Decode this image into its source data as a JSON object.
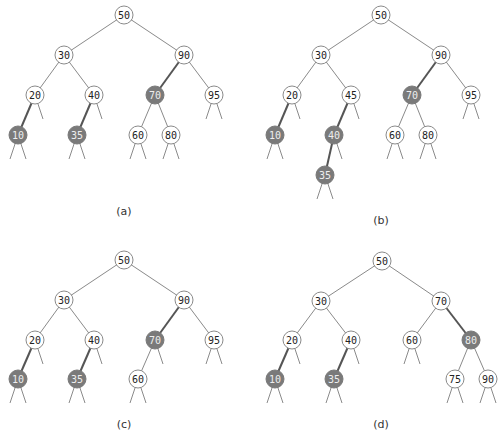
{
  "figure": {
    "panels": [
      {
        "id": "a",
        "caption": "(a)",
        "caption_pos": [
          124,
          215
        ],
        "nodes": [
          {
            "key": "50",
            "x": 124,
            "y": 15,
            "shaded": false
          },
          {
            "key": "30",
            "x": 64,
            "y": 55,
            "shaded": false
          },
          {
            "key": "90",
            "x": 184,
            "y": 55,
            "shaded": false
          },
          {
            "key": "20",
            "x": 35,
            "y": 95,
            "shaded": false
          },
          {
            "key": "40",
            "x": 94,
            "y": 95,
            "shaded": false
          },
          {
            "key": "70",
            "x": 155,
            "y": 95,
            "shaded": true
          },
          {
            "key": "95",
            "x": 214,
            "y": 95,
            "shaded": false
          },
          {
            "key": "10",
            "x": 18,
            "y": 135,
            "shaded": true
          },
          {
            "key": "35",
            "x": 77,
            "y": 135,
            "shaded": true
          },
          {
            "key": "60",
            "x": 138,
            "y": 135,
            "shaded": false
          },
          {
            "key": "80",
            "x": 171,
            "y": 135,
            "shaded": false
          }
        ],
        "edges": [
          [
            "50",
            "30",
            false
          ],
          [
            "50",
            "90",
            false
          ],
          [
            "30",
            "20",
            false
          ],
          [
            "30",
            "40",
            false
          ],
          [
            "90",
            "70",
            true
          ],
          [
            "90",
            "95",
            false
          ],
          [
            "20",
            "10",
            true
          ],
          [
            "40",
            "35",
            true
          ],
          [
            "70",
            "60",
            false
          ],
          [
            "70",
            "80",
            false
          ]
        ],
        "stubs": [
          [
            "20",
            1
          ],
          [
            "40",
            1
          ],
          [
            "95",
            0
          ],
          [
            "95",
            1
          ],
          [
            "10",
            0
          ],
          [
            "10",
            1
          ],
          [
            "35",
            0
          ],
          [
            "35",
            1
          ],
          [
            "60",
            0
          ],
          [
            "60",
            1
          ],
          [
            "80",
            0
          ],
          [
            "80",
            1
          ]
        ]
      },
      {
        "id": "b",
        "caption": "(b)",
        "caption_pos": [
          381,
          224
        ],
        "nodes": [
          {
            "key": "50",
            "x": 381,
            "y": 15,
            "shaded": false
          },
          {
            "key": "30",
            "x": 321,
            "y": 55,
            "shaded": false
          },
          {
            "key": "90",
            "x": 441,
            "y": 55,
            "shaded": false
          },
          {
            "key": "20",
            "x": 292,
            "y": 95,
            "shaded": false
          },
          {
            "key": "45",
            "x": 351,
            "y": 95,
            "shaded": false
          },
          {
            "key": "70",
            "x": 412,
            "y": 95,
            "shaded": true
          },
          {
            "key": "95",
            "x": 471,
            "y": 95,
            "shaded": false
          },
          {
            "key": "10",
            "x": 275,
            "y": 135,
            "shaded": true
          },
          {
            "key": "40",
            "x": 334,
            "y": 135,
            "shaded": true
          },
          {
            "key": "60",
            "x": 395,
            "y": 135,
            "shaded": false
          },
          {
            "key": "80",
            "x": 428,
            "y": 135,
            "shaded": false
          },
          {
            "key": "35",
            "x": 325,
            "y": 175,
            "shaded": true
          }
        ],
        "edges": [
          [
            "50",
            "30",
            false
          ],
          [
            "50",
            "90",
            false
          ],
          [
            "30",
            "20",
            false
          ],
          [
            "30",
            "45",
            false
          ],
          [
            "90",
            "70",
            true
          ],
          [
            "90",
            "95",
            false
          ],
          [
            "20",
            "10",
            true
          ],
          [
            "45",
            "40",
            true
          ],
          [
            "70",
            "60",
            false
          ],
          [
            "70",
            "80",
            false
          ],
          [
            "40",
            "35",
            true
          ]
        ],
        "stubs": [
          [
            "20",
            1
          ],
          [
            "45",
            1
          ],
          [
            "95",
            0
          ],
          [
            "95",
            1
          ],
          [
            "10",
            0
          ],
          [
            "10",
            1
          ],
          [
            "40",
            1
          ],
          [
            "60",
            0
          ],
          [
            "60",
            1
          ],
          [
            "80",
            0
          ],
          [
            "80",
            1
          ],
          [
            "35",
            0
          ],
          [
            "35",
            1
          ]
        ]
      },
      {
        "id": "c",
        "caption": "(c)",
        "caption_pos": [
          124,
          428
        ],
        "nodes": [
          {
            "key": "50",
            "x": 124,
            "y": 260,
            "shaded": false
          },
          {
            "key": "30",
            "x": 64,
            "y": 300,
            "shaded": false
          },
          {
            "key": "90",
            "x": 184,
            "y": 300,
            "shaded": false
          },
          {
            "key": "20",
            "x": 35,
            "y": 340,
            "shaded": false
          },
          {
            "key": "40",
            "x": 94,
            "y": 340,
            "shaded": false
          },
          {
            "key": "70",
            "x": 155,
            "y": 340,
            "shaded": true
          },
          {
            "key": "95",
            "x": 214,
            "y": 340,
            "shaded": false
          },
          {
            "key": "10",
            "x": 18,
            "y": 379,
            "shaded": true
          },
          {
            "key": "35",
            "x": 77,
            "y": 379,
            "shaded": true
          },
          {
            "key": "60",
            "x": 138,
            "y": 379,
            "shaded": false
          }
        ],
        "edges": [
          [
            "50",
            "30",
            false
          ],
          [
            "50",
            "90",
            false
          ],
          [
            "30",
            "20",
            false
          ],
          [
            "30",
            "40",
            false
          ],
          [
            "90",
            "70",
            true
          ],
          [
            "90",
            "95",
            false
          ],
          [
            "20",
            "10",
            true
          ],
          [
            "40",
            "35",
            true
          ],
          [
            "70",
            "60",
            false
          ]
        ],
        "stubs": [
          [
            "20",
            1
          ],
          [
            "40",
            1
          ],
          [
            "70",
            1
          ],
          [
            "95",
            0
          ],
          [
            "95",
            1
          ],
          [
            "10",
            0
          ],
          [
            "10",
            1
          ],
          [
            "35",
            0
          ],
          [
            "35",
            1
          ],
          [
            "60",
            0
          ],
          [
            "60",
            1
          ]
        ]
      },
      {
        "id": "d",
        "caption": "(d)",
        "caption_pos": [
          381,
          428
        ],
        "nodes": [
          {
            "key": "50",
            "x": 382,
            "y": 261,
            "shaded": false
          },
          {
            "key": "30",
            "x": 321,
            "y": 301,
            "shaded": false
          },
          {
            "key": "70",
            "x": 441,
            "y": 301,
            "shaded": false
          },
          {
            "key": "20",
            "x": 292,
            "y": 340,
            "shaded": false
          },
          {
            "key": "40",
            "x": 351,
            "y": 340,
            "shaded": false
          },
          {
            "key": "60",
            "x": 412,
            "y": 340,
            "shaded": false
          },
          {
            "key": "80",
            "x": 471,
            "y": 340,
            "shaded": true
          },
          {
            "key": "10",
            "x": 275,
            "y": 379,
            "shaded": true
          },
          {
            "key": "35",
            "x": 334,
            "y": 379,
            "shaded": true
          },
          {
            "key": "75",
            "x": 455,
            "y": 379,
            "shaded": false
          },
          {
            "key": "90",
            "x": 488,
            "y": 379,
            "shaded": false
          }
        ],
        "edges": [
          [
            "50",
            "30",
            false
          ],
          [
            "50",
            "70",
            false
          ],
          [
            "30",
            "20",
            false
          ],
          [
            "30",
            "40",
            false
          ],
          [
            "70",
            "60",
            false
          ],
          [
            "70",
            "80",
            true
          ],
          [
            "20",
            "10",
            true
          ],
          [
            "40",
            "35",
            true
          ],
          [
            "80",
            "75",
            false
          ],
          [
            "80",
            "90",
            false
          ]
        ],
        "stubs": [
          [
            "20",
            1
          ],
          [
            "40",
            1
          ],
          [
            "60",
            0
          ],
          [
            "60",
            1
          ],
          [
            "10",
            0
          ],
          [
            "10",
            1
          ],
          [
            "35",
            0
          ],
          [
            "35",
            1
          ],
          [
            "75",
            0
          ],
          [
            "75",
            1
          ],
          [
            "90",
            0
          ],
          [
            "90",
            1
          ]
        ]
      }
    ],
    "colors": {
      "shaded_node": "#7a7a7a",
      "edge": "#8a8a8a",
      "highlight_edge": "#555555"
    }
  }
}
